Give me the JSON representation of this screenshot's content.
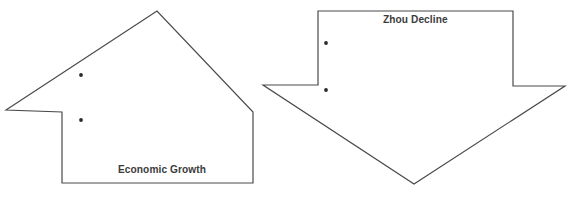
{
  "diagram": {
    "type": "two-crossing-block-arrows",
    "background_color": "#ffffff",
    "outline_color": "#4a4a4a",
    "dot_color": "#2a2a2a",
    "label_color": "#3b3b3b",
    "shapes": [
      {
        "id": "economic-growth-arrow",
        "label": "Economic Growth",
        "direction": "up-left",
        "points": "6,110 157,11 253,112 253,183 62,183 62,112",
        "dots": [
          {
            "cx": 81,
            "cy": 75
          },
          {
            "cx": 81,
            "cy": 120
          }
        ]
      },
      {
        "id": "zhou-decline-arrow",
        "label": "Zhou Decline",
        "direction": "down-right",
        "points": "318,11 513,11 513,86 565,86 414,184 263,85 318,85",
        "dots": [
          {
            "cx": 326,
            "cy": 43
          },
          {
            "cx": 326,
            "cy": 90
          }
        ]
      }
    ],
    "labels": {
      "economic_growth": "Economic Growth",
      "zhou_decline": "Zhou Decline"
    }
  }
}
